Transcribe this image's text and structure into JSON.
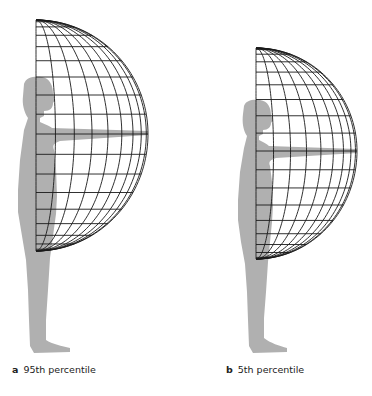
{
  "figures": [
    {
      "id": "a",
      "letter": "a",
      "label": "95th percentile",
      "globe": {
        "cx": 36,
        "cy": 134,
        "rx": 112,
        "ry_top": 114,
        "ry_bottom": 117,
        "lat_step_deg": 10,
        "lon_step_deg": 10
      },
      "silhouette_color": "#b0b0b0",
      "caption_pos": {
        "x": 12,
        "y": 364
      }
    },
    {
      "id": "b",
      "letter": "b",
      "label": "5th percentile",
      "globe": {
        "cx": 256,
        "cy": 151,
        "rx": 101,
        "ry_top": 103,
        "ry_bottom": 108,
        "lat_step_deg": 10,
        "lon_step_deg": 10
      },
      "silhouette_color": "#b0b0b0",
      "caption_pos": {
        "x": 226,
        "y": 364
      }
    }
  ],
  "colors": {
    "grid": "#1a1a1a",
    "silhouette": "#b0b0b0",
    "caption": "#222222"
  }
}
